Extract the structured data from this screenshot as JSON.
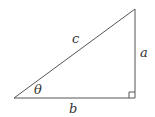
{
  "diagram": {
    "type": "right-triangle",
    "labels": {
      "hypotenuse": "c",
      "opposite": "a",
      "adjacent": "b",
      "angle": "θ"
    },
    "colors": {
      "stroke": "#555555",
      "text": "#333333",
      "background": "#ffffff"
    }
  }
}
